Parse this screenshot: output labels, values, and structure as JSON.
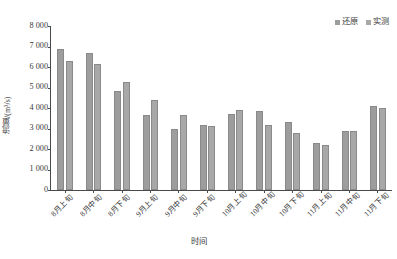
{
  "chart_data": {
    "type": "bar",
    "title": "",
    "xlabel": "时间",
    "ylabel": "流量/(m³/s)",
    "ylim": [
      0,
      8000
    ],
    "ytick_step": 1000,
    "ytick_labels": [
      "8 000",
      "7 000",
      "6 000",
      "5 000",
      "4 000",
      "3 000",
      "2 000",
      "1 000",
      "0"
    ],
    "ytick_values": [
      8000,
      7000,
      6000,
      5000,
      4000,
      3000,
      2000,
      1000,
      0
    ],
    "grid": false,
    "legend_position": "top-right",
    "categories": [
      "8月上旬",
      "8月中旬",
      "8月下旬",
      "9月上旬",
      "9月中旬",
      "9月下旬",
      "10月上旬",
      "10月中旬",
      "10月下旬",
      "11月上旬",
      "11月中旬",
      "11月下旬"
    ],
    "series": [
      {
        "name": "还原",
        "color": "#9d9d9d",
        "values": [
          6900,
          6700,
          4850,
          3650,
          3000,
          3150,
          3700,
          3850,
          3300,
          2300,
          2900,
          4100
        ]
      },
      {
        "name": "实测",
        "color": "#a8a8a8",
        "values": [
          6300,
          6150,
          5250,
          4400,
          3650,
          3100,
          3900,
          3150,
          2800,
          2200,
          2900,
          4000
        ]
      }
    ]
  },
  "legend": {
    "items": [
      {
        "label": "还原"
      },
      {
        "label": "实测"
      }
    ]
  }
}
